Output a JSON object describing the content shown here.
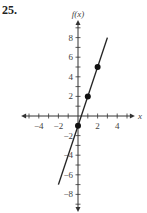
{
  "problem_number": "25.",
  "chart_data": {
    "type": "line",
    "title": "",
    "xlabel": "x",
    "ylabel": "f(x)",
    "xlim": [
      -5.5,
      5.5
    ],
    "ylim": [
      -9.5,
      9.5
    ],
    "grid": false,
    "x_ticks": [
      -4,
      -2,
      2,
      4
    ],
    "y_ticks": [
      8,
      6,
      4,
      2,
      -2,
      -4,
      -6,
      -8
    ],
    "series": [
      {
        "name": "f(x) = 3x - 1",
        "line_from": [
          -2,
          -7
        ],
        "line_to": [
          3,
          8
        ],
        "points": [
          {
            "x": 0,
            "y": -1
          },
          {
            "x": 1,
            "y": 2
          },
          {
            "x": 2,
            "y": 5
          }
        ]
      }
    ]
  }
}
